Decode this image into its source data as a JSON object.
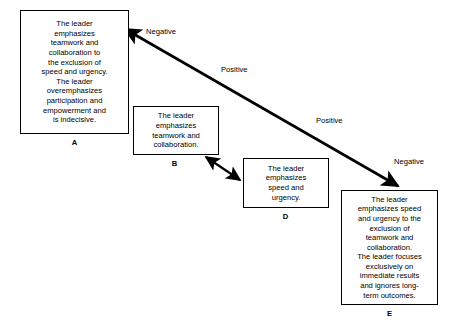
{
  "diagram": {
    "background_color": "#ffffff",
    "line_color": "#000000",
    "boxes": [
      {
        "id": "A",
        "label": "A",
        "text": "The leader\nemphasizes\nteamwork and\ncollaboration to\nthe exclusion of\nspeed and urgency.\nThe leader\noveremphasizes\nparticipation and\nempowerment and\nis indecisive."
      },
      {
        "id": "B",
        "label": "B",
        "text": "The leader\nemphasizes\nteamwork and\ncollaboration."
      },
      {
        "id": "D",
        "label": "D",
        "text": "The leader\nemphasizes\nspeed and\nurgency."
      },
      {
        "id": "E",
        "label": "E",
        "text": "The leader\nemphasizes speed\nand urgency to the\nexclusion of\nteamwork and\ncollaboration.\nThe leader focuses\nexclusively on\nimmediate results\nand ignores long-\nterm outcomes."
      }
    ],
    "edge_labels": [
      {
        "id": "negative-top-left",
        "text": "Negative"
      },
      {
        "id": "positive-upper",
        "text": "Positive"
      },
      {
        "id": "positive-lower",
        "text": "Positive"
      },
      {
        "id": "negative-bottom-right",
        "text": "Negative"
      }
    ],
    "connectors": [
      {
        "id": "main-continuum-arrow",
        "name": "double-headed-diagonal-arrow",
        "from": "A",
        "to": "E",
        "style": "double-headed"
      },
      {
        "id": "b-d-arrow",
        "name": "double-headed-short-arrow",
        "from": "B",
        "to": "D",
        "style": "double-headed"
      }
    ]
  }
}
